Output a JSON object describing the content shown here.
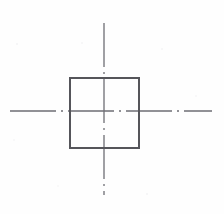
{
  "canvas": {
    "width": 224,
    "height": 214,
    "background_color": "#fefefe",
    "title": "Centered Square With Centerlines"
  },
  "palette": {
    "square_stroke": "#55555a",
    "centerline_stroke": "#6e6e74",
    "background": "#fefefe",
    "speck_color": "#e8e8ea"
  },
  "drawing": {
    "type": "technical-line-drawing",
    "center_point": {
      "x": 104,
      "y": 111
    },
    "square": {
      "name": "square-outline",
      "x": 70,
      "y": 78,
      "width": 69,
      "height": 70,
      "stroke_width": 1.1,
      "fill": "none"
    },
    "vertical_centerline": {
      "name": "vertical-centerline",
      "x": 104,
      "y_start": 23,
      "y_end": 195,
      "stroke_width": 1.3,
      "dash_pattern": "44 5 2 5"
    },
    "horizontal_centerline": {
      "name": "horizontal-centerline",
      "x_start": 10,
      "x_end": 212,
      "y": 111,
      "stroke_width": 1.3,
      "dash_pattern": "46 5 2 5"
    }
  },
  "artifacts": {
    "specks": [
      {
        "x": 17,
        "y": 44,
        "r": 1.0,
        "opacity": 0.45
      },
      {
        "x": 82,
        "y": 43,
        "r": 0.8,
        "opacity": 0.35
      },
      {
        "x": 162,
        "y": 49,
        "r": 0.9,
        "opacity": 0.4
      },
      {
        "x": 14,
        "y": 140,
        "r": 0.8,
        "opacity": 0.3
      },
      {
        "x": 196,
        "y": 96,
        "r": 0.7,
        "opacity": 0.3
      },
      {
        "x": 147,
        "y": 194,
        "r": 1.0,
        "opacity": 0.45
      },
      {
        "x": 58,
        "y": 186,
        "r": 0.7,
        "opacity": 0.28
      }
    ]
  }
}
